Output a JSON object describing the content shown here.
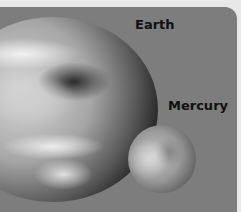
{
  "image": {
    "description": "Grayscale size comparison of Earth and Mercury",
    "labels": {
      "earth": "Earth",
      "mercury": "Mercury"
    },
    "colors": {
      "background_panel": "#7d7d7d",
      "border": "#e8e8e8",
      "label_text": "#111111"
    }
  }
}
